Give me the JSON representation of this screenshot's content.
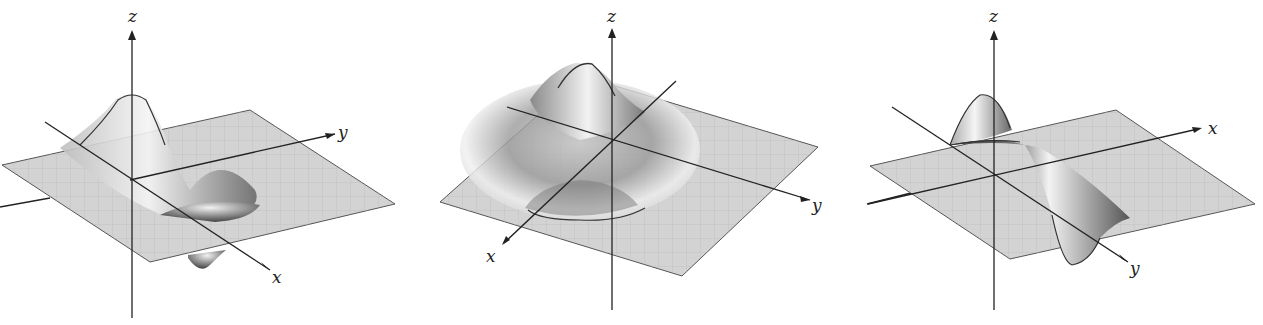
{
  "figures": [
    {
      "id": "left",
      "axes": {
        "z": "z",
        "y": "y",
        "x": "x"
      },
      "description": "Surface with a peak and a trough along the x-direction, y axis to the right"
    },
    {
      "id": "middle",
      "axes": {
        "z": "z",
        "y": "y",
        "x": "x"
      },
      "description": "Surface with a central peak surrounded by a ring-shaped trough"
    },
    {
      "id": "right",
      "axes": {
        "z": "z",
        "x": "x",
        "y": "y"
      },
      "description": "Surface with a peak and a trough along the y-direction, x axis to the right"
    }
  ],
  "colors": {
    "plane": "#cfcfcf",
    "grid": "#b5b5b5",
    "axis": "#222222",
    "surface_dark": "#555555",
    "surface_light": "#f0f0f0"
  }
}
